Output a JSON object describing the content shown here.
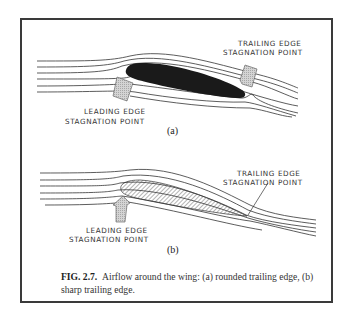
{
  "figure": {
    "number": "FIG. 2.7.",
    "caption": "Airflow around the wing: (a) rounded trailing edge, (b) sharp trailing edge."
  },
  "panel_a": {
    "label": "(a)",
    "airfoil_style": "solid black, rounded trailing edge",
    "annotations": {
      "trailing_line1": "TRAILING EDGE",
      "trailing_line2": "STAGNATION POINT",
      "leading_line1": "LEADING EDGE",
      "leading_line2": "STAGNATION POINT"
    }
  },
  "panel_b": {
    "label": "(b)",
    "airfoil_style": "hatched, sharp trailing edge",
    "annotations": {
      "trailing_line1": "TRAILING EDGE",
      "trailing_line2": "STAGNATION POINT",
      "leading_line1": "LEADING EDGE",
      "leading_line2": "STAGNATION POINT"
    }
  },
  "colors": {
    "line": "#333333",
    "airfoil_fill": "#1a1a1a",
    "arrow_fill": "#c8c8c8",
    "frame": "#3a3a3a"
  }
}
